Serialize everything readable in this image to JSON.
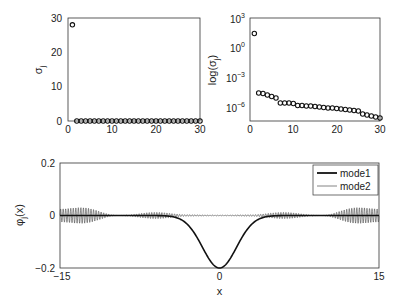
{
  "chart_data": [
    {
      "type": "scatter",
      "title": "",
      "xlabel": "",
      "ylabel": "σ_j",
      "xlim": [
        0,
        30
      ],
      "ylim": [
        0,
        30
      ],
      "xticks": [
        "0",
        "10",
        "20",
        "30"
      ],
      "yticks": [
        "0",
        "10",
        "20",
        "30"
      ],
      "marker": "open-circle",
      "x": [
        1,
        2,
        3,
        4,
        5,
        6,
        7,
        8,
        9,
        10,
        11,
        12,
        13,
        14,
        15,
        16,
        17,
        18,
        19,
        20,
        21,
        22,
        23,
        24,
        25,
        26,
        27,
        28,
        29,
        30
      ],
      "values": [
        28,
        0,
        0,
        0,
        0,
        0,
        0,
        0,
        0,
        0,
        0,
        0,
        0,
        0,
        0,
        0,
        0,
        0,
        0,
        0,
        0,
        0,
        0,
        0,
        0,
        0,
        0,
        0,
        0,
        0
      ]
    },
    {
      "type": "scatter",
      "title": "",
      "xlabel": "",
      "ylabel": "log(σ_j)",
      "yscale": "log",
      "xlim": [
        0,
        30
      ],
      "ylim_log10": [
        -7.3,
        3
      ],
      "xticks": [
        "0",
        "10",
        "20",
        "30"
      ],
      "yticks": [
        "10^3",
        "10^0",
        "10^-3",
        "10^-6"
      ],
      "marker": "open-circle",
      "x": [
        1,
        2,
        3,
        4,
        5,
        6,
        7,
        8,
        9,
        10,
        11,
        12,
        13,
        14,
        15,
        16,
        17,
        18,
        19,
        20,
        21,
        22,
        23,
        24,
        25,
        26,
        27,
        28,
        29,
        30
      ],
      "log10_values": [
        1.45,
        -4.5,
        -4.55,
        -4.7,
        -4.85,
        -5.0,
        -5.5,
        -5.5,
        -5.5,
        -5.55,
        -5.75,
        -5.75,
        -5.8,
        -5.8,
        -5.85,
        -5.9,
        -5.95,
        -6.0,
        -6.0,
        -6.05,
        -6.1,
        -6.15,
        -6.2,
        -6.25,
        -6.3,
        -6.6,
        -6.7,
        -6.8,
        -6.9,
        -7.0
      ]
    },
    {
      "type": "line",
      "title": "",
      "xlabel": "x",
      "ylabel": "φ_j(x)",
      "xlim": [
        -15,
        15
      ],
      "ylim": [
        -0.2,
        0.2
      ],
      "xticks": [
        "-15",
        "0",
        "15"
      ],
      "yticks": [
        "0.2",
        "0",
        "-0.2"
      ],
      "legend": {
        "position": "upper right",
        "entries": [
          "mode1",
          "mode2"
        ]
      },
      "series": [
        {
          "name": "mode1",
          "description": "smooth negative Gaussian-like dip centered at x=0, minimum -0.2, near zero for |x|>6",
          "x": [
            -15,
            -6,
            -4,
            -3,
            -2,
            -1,
            0,
            1,
            2,
            3,
            4,
            6,
            15
          ],
          "values": [
            0,
            -0.003,
            -0.02,
            -0.045,
            -0.1,
            -0.165,
            -0.2,
            -0.165,
            -0.1,
            -0.045,
            -0.02,
            -0.003,
            0
          ]
        },
        {
          "name": "mode2",
          "description": "high-frequency oscillation around 0 with beating envelope; large envelope ~±0.03 near x=±13, smaller lobes ~±0.01 near x=±6, near-zero nodes around x=±9.5 and x≈0",
          "x": [
            -15,
            -13,
            -9.5,
            -6,
            -3,
            0,
            3,
            6,
            9.5,
            13,
            15
          ],
          "envelope": [
            0.025,
            0.03,
            0.0,
            0.012,
            0.003,
            0.002,
            0.003,
            0.012,
            0.0,
            0.03,
            0.025
          ]
        }
      ]
    }
  ],
  "labels": {
    "plot1_ylabel": "σ",
    "plot1_ylabel_sub": "j",
    "plot2_ylabel": "log(σ",
    "plot2_ylabel_sub": "j",
    "plot2_ylabel_end": ")",
    "plot3_ylabel": "φ",
    "plot3_ylabel_sub": "j",
    "plot3_ylabel_end": "(x)",
    "plot3_xlabel": "x",
    "legend_mode1": "mode1",
    "legend_mode2": "mode2"
  },
  "ticks": {
    "p1_x": [
      "0",
      "10",
      "20",
      "30"
    ],
    "p1_y": [
      "30",
      "20",
      "10",
      "0"
    ],
    "p2_x": [
      "0",
      "10",
      "20",
      "30"
    ],
    "p2_y_base": [
      "10",
      "10",
      "10",
      "10"
    ],
    "p2_y_exp": [
      "3",
      "0",
      "−3",
      "−6"
    ],
    "p3_x": [
      "−15",
      "0",
      "15"
    ],
    "p3_y": [
      "0.2",
      "0",
      "−0.2"
    ]
  }
}
